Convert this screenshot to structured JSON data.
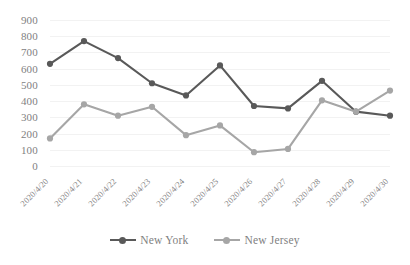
{
  "chart_data": {
    "type": "line",
    "title": "",
    "xlabel": "",
    "ylabel": "",
    "ylim": [
      0,
      900
    ],
    "ytick_step": 100,
    "grid": true,
    "legend_position": "bottom",
    "categories": [
      "2020/4/20",
      "2020/4/21",
      "2020/4/22",
      "2020/4/23",
      "2020/4/24",
      "2020/4/25",
      "2020/4/26",
      "2020/4/27",
      "2020/4/28",
      "2020/4/29",
      "2020/4/30"
    ],
    "ytick_labels": [
      "900",
      "800",
      "700",
      "600",
      "500",
      "400",
      "300",
      "200",
      "100",
      "0"
    ],
    "series": [
      {
        "name": "New York",
        "color": "#595959",
        "marker": "circle",
        "values": [
          630,
          770,
          665,
          510,
          435,
          620,
          370,
          355,
          525,
          335,
          310
        ]
      },
      {
        "name": "New Jersey",
        "color": "#a6a6a6",
        "marker": "circle",
        "values": [
          170,
          380,
          310,
          365,
          190,
          250,
          85,
          105,
          405,
          335,
          465
        ]
      }
    ]
  },
  "colors": {
    "background": "#ffffff",
    "gridline": "#f2f2f2",
    "tick_text": "#7f7f7f",
    "new_york": "#595959",
    "new_jersey": "#a6a6a6"
  }
}
